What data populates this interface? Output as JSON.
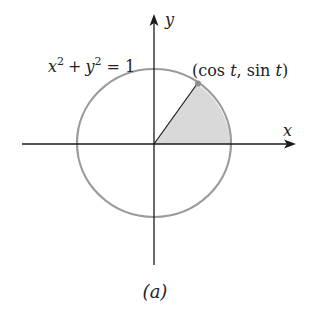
{
  "figure": {
    "caption": "(a)",
    "equation": {
      "x": "x",
      "x_exp": "2",
      "plus": "+",
      "y": "y",
      "y_exp": "2",
      "eq": "=",
      "rhs": "1"
    },
    "point_label": {
      "open": "(cos ",
      "t1": "t",
      "mid": ", sin ",
      "t2": "t",
      "close": ")"
    },
    "axes": {
      "x_label": "x",
      "y_label": "y"
    },
    "colors": {
      "axis": "#1a1a1a",
      "circle": "#9a9a9a",
      "sector_fill": "#d9d9d9",
      "point": "#8f8f8f"
    }
  }
}
